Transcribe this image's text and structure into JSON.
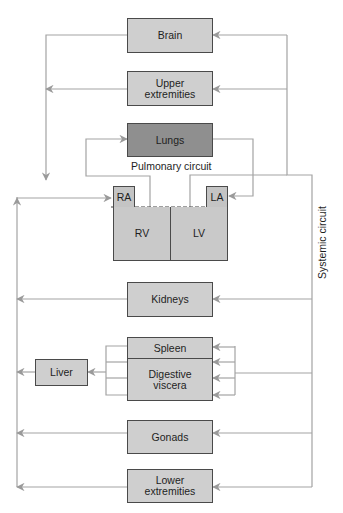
{
  "colors": {
    "line": "#a3a3a3",
    "box_fill": "#cfcfcf",
    "lungs_fill": "#8f8f8f",
    "box_border": "#4a4a4a",
    "text": "#1e1e1e"
  },
  "organs": {
    "brain": "Brain",
    "upper_extremities": [
      "Upper",
      "extremities"
    ],
    "lungs": "Lungs",
    "kidneys": "Kidneys",
    "spleen": "Spleen",
    "digestive_viscera": [
      "Digestive",
      "viscera"
    ],
    "liver": "Liver",
    "gonads": "Gonads",
    "lower_extremities": [
      "Lower",
      "extremities"
    ]
  },
  "heart": {
    "ra": "RA",
    "la": "LA",
    "rv": "RV",
    "lv": "LV"
  },
  "circuits": {
    "pulmonary": "Pulmonary circuit",
    "systemic": "Systemic circuit"
  }
}
